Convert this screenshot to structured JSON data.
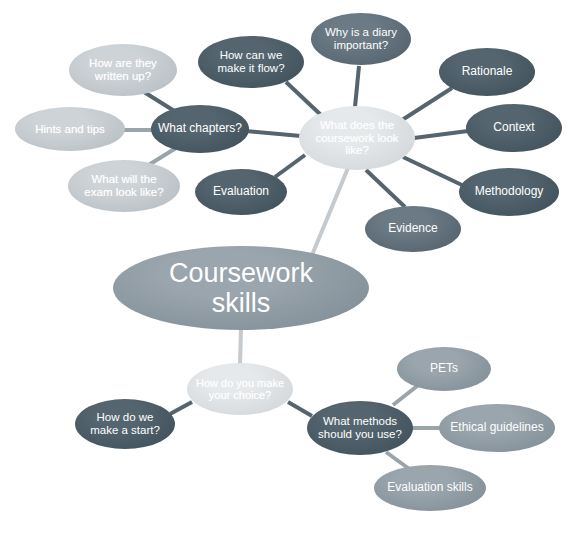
{
  "diagram": {
    "type": "mind-map",
    "background_color": "#ffffff",
    "palette": {
      "dark_slate": "#4a5b66",
      "mid_slate": "#5e6f79",
      "medium_gray": "#8f9ba3",
      "light_gray": "#c9cfd3",
      "pale_gray": "#dfe3e5",
      "edge_dark": "#55646d",
      "edge_light": "#b9c0c5",
      "text": "#ffffff"
    }
  },
  "nodes": [
    {
      "id": "root",
      "label": "Coursework skills",
      "lines": [
        "Coursework",
        "skills"
      ],
      "shade": "medium",
      "font_size": 27,
      "cx": 241,
      "cy": 288,
      "rx": 128,
      "ry": 42
    },
    {
      "id": "coursework-look",
      "label": "What does the coursework look like?",
      "lines": [
        "What does the",
        "coursework look",
        "like?"
      ],
      "shade": "pale",
      "font_size": 11.5,
      "cx": 357,
      "cy": 138,
      "rx": 58,
      "ry": 32
    },
    {
      "id": "what-chapters",
      "label": "What chapters?",
      "lines": [
        "What chapters?"
      ],
      "shade": "dark",
      "font_size": 12,
      "cx": 200,
      "cy": 129,
      "rx": 49,
      "ry": 24
    },
    {
      "id": "how-written-up",
      "label": "How are they written up?",
      "lines": [
        "How are they",
        "written up?"
      ],
      "shade": "light",
      "font_size": 11.5,
      "cx": 123,
      "cy": 70,
      "rx": 54,
      "ry": 26
    },
    {
      "id": "hints-tips",
      "label": "Hints and tips",
      "lines": [
        "Hints and tips"
      ],
      "shade": "light",
      "font_size": 11.5,
      "cx": 70,
      "cy": 129,
      "rx": 55,
      "ry": 22
    },
    {
      "id": "exam-look-like",
      "label": "What will the exam look like?",
      "lines": [
        "What will the",
        "exam look like?"
      ],
      "shade": "light",
      "font_size": 11.5,
      "cx": 124,
      "cy": 186,
      "rx": 56,
      "ry": 26
    },
    {
      "id": "how-flow",
      "label": "How can we make it flow?",
      "lines": [
        "How can we",
        "make it flow?"
      ],
      "shade": "dark",
      "font_size": 11.5,
      "cx": 251,
      "cy": 62,
      "rx": 53,
      "ry": 26
    },
    {
      "id": "diary-important",
      "label": "Why is a diary important?",
      "lines": [
        "Why is a diary",
        "important?"
      ],
      "shade": "mid",
      "font_size": 11.5,
      "cx": 361,
      "cy": 39,
      "rx": 50,
      "ry": 26
    },
    {
      "id": "rationale",
      "label": "Rationale",
      "lines": [
        "Rationale"
      ],
      "shade": "dark",
      "font_size": 12,
      "cx": 487,
      "cy": 72,
      "rx": 48,
      "ry": 24
    },
    {
      "id": "context",
      "label": "Context",
      "lines": [
        "Context"
      ],
      "shade": "dark",
      "font_size": 12,
      "cx": 514,
      "cy": 128,
      "rx": 48,
      "ry": 24
    },
    {
      "id": "methodology",
      "label": "Methodology",
      "lines": [
        "Methodology"
      ],
      "shade": "dark",
      "font_size": 12,
      "cx": 509,
      "cy": 192,
      "rx": 50,
      "ry": 24
    },
    {
      "id": "evidence",
      "label": "Evidence",
      "lines": [
        "Evidence"
      ],
      "shade": "mid",
      "font_size": 12,
      "cx": 413,
      "cy": 229,
      "rx": 48,
      "ry": 23
    },
    {
      "id": "evaluation",
      "label": "Evaluation",
      "lines": [
        "Evaluation"
      ],
      "shade": "dark",
      "font_size": 12,
      "cx": 241,
      "cy": 192,
      "rx": 46,
      "ry": 23
    },
    {
      "id": "make-your-choice",
      "label": "How do you make your choice?",
      "lines": [
        "How do you make",
        "your choice?"
      ],
      "shade": "pale",
      "font_size": 11,
      "cx": 240,
      "cy": 389,
      "rx": 53,
      "ry": 26
    },
    {
      "id": "how-make-start",
      "label": "How do we make a start?",
      "lines": [
        "How do we",
        "make a start?"
      ],
      "shade": "dark",
      "font_size": 11.5,
      "cx": 125,
      "cy": 424,
      "rx": 50,
      "ry": 25
    },
    {
      "id": "what-methods",
      "label": "What methods should you use?",
      "lines": [
        "What methods",
        "should you use?"
      ],
      "shade": "dark",
      "font_size": 11.5,
      "cx": 360,
      "cy": 428,
      "rx": 53,
      "ry": 27
    },
    {
      "id": "pets",
      "label": "PETs",
      "lines": [
        "PETs"
      ],
      "shade": "medium",
      "font_size": 12,
      "cx": 444,
      "cy": 369,
      "rx": 47,
      "ry": 22
    },
    {
      "id": "ethical-guidelines",
      "label": "Ethical guidelines",
      "lines": [
        "Ethical guidelines"
      ],
      "shade": "medium",
      "font_size": 12,
      "cx": 497,
      "cy": 428,
      "rx": 58,
      "ry": 24
    },
    {
      "id": "evaluation-skills",
      "label": "Evaluation skills",
      "lines": [
        "Evaluation skills"
      ],
      "shade": "medium",
      "font_size": 12,
      "cx": 430,
      "cy": 488,
      "rx": 56,
      "ry": 23
    }
  ],
  "edges": [
    {
      "from": "root",
      "to": "coursework-look",
      "x1": 310,
      "y1": 260,
      "x2": 348,
      "y2": 168,
      "width": 4,
      "tone": "light"
    },
    {
      "from": "root",
      "to": "make-your-choice",
      "x1": 241,
      "y1": 328,
      "x2": 240,
      "y2": 365,
      "width": 4,
      "tone": "light"
    },
    {
      "from": "coursework-look",
      "to": "what-chapters",
      "x1": 301,
      "y1": 136,
      "x2": 246,
      "y2": 131,
      "width": 4,
      "tone": "dark"
    },
    {
      "from": "coursework-look",
      "to": "how-flow",
      "x1": 322,
      "y1": 116,
      "x2": 286,
      "y2": 82,
      "width": 4,
      "tone": "dark"
    },
    {
      "from": "coursework-look",
      "to": "diary-important",
      "x1": 355,
      "y1": 107,
      "x2": 359,
      "y2": 66,
      "width": 4,
      "tone": "dark"
    },
    {
      "from": "coursework-look",
      "to": "rationale",
      "x1": 399,
      "y1": 122,
      "x2": 452,
      "y2": 88,
      "width": 4,
      "tone": "dark"
    },
    {
      "from": "coursework-look",
      "to": "context",
      "x1": 414,
      "y1": 138,
      "x2": 468,
      "y2": 131,
      "width": 4,
      "tone": "dark"
    },
    {
      "from": "coursework-look",
      "to": "methodology",
      "x1": 403,
      "y1": 157,
      "x2": 464,
      "y2": 186,
      "width": 4,
      "tone": "dark"
    },
    {
      "from": "coursework-look",
      "to": "evidence",
      "x1": 366,
      "y1": 170,
      "x2": 405,
      "y2": 207,
      "width": 4,
      "tone": "dark"
    },
    {
      "from": "coursework-look",
      "to": "evaluation",
      "x1": 305,
      "y1": 155,
      "x2": 275,
      "y2": 177,
      "width": 4,
      "tone": "dark"
    },
    {
      "from": "what-chapters",
      "to": "how-written-up",
      "x1": 176,
      "y1": 112,
      "x2": 144,
      "y2": 92,
      "width": 4,
      "tone": "dark"
    },
    {
      "from": "what-chapters",
      "to": "hints-tips",
      "x1": 152,
      "y1": 130,
      "x2": 123,
      "y2": 130,
      "width": 4,
      "tone": "medium"
    },
    {
      "from": "what-chapters",
      "to": "exam-look-like",
      "x1": 176,
      "y1": 148,
      "x2": 147,
      "y2": 166,
      "width": 4,
      "tone": "medium"
    },
    {
      "from": "make-your-choice",
      "to": "how-make-start",
      "x1": 192,
      "y1": 402,
      "x2": 170,
      "y2": 414,
      "width": 4,
      "tone": "dark"
    },
    {
      "from": "make-your-choice",
      "to": "what-methods",
      "x1": 288,
      "y1": 402,
      "x2": 312,
      "y2": 416,
      "width": 4,
      "tone": "dark"
    },
    {
      "from": "what-methods",
      "to": "pets",
      "x1": 393,
      "y1": 405,
      "x2": 421,
      "y2": 383,
      "width": 4,
      "tone": "medium"
    },
    {
      "from": "what-methods",
      "to": "ethical-guidelines",
      "x1": 412,
      "y1": 428,
      "x2": 443,
      "y2": 428,
      "width": 4,
      "tone": "medium"
    },
    {
      "from": "what-methods",
      "to": "evaluation-skills",
      "x1": 386,
      "y1": 452,
      "x2": 412,
      "y2": 471,
      "width": 4,
      "tone": "medium"
    }
  ]
}
